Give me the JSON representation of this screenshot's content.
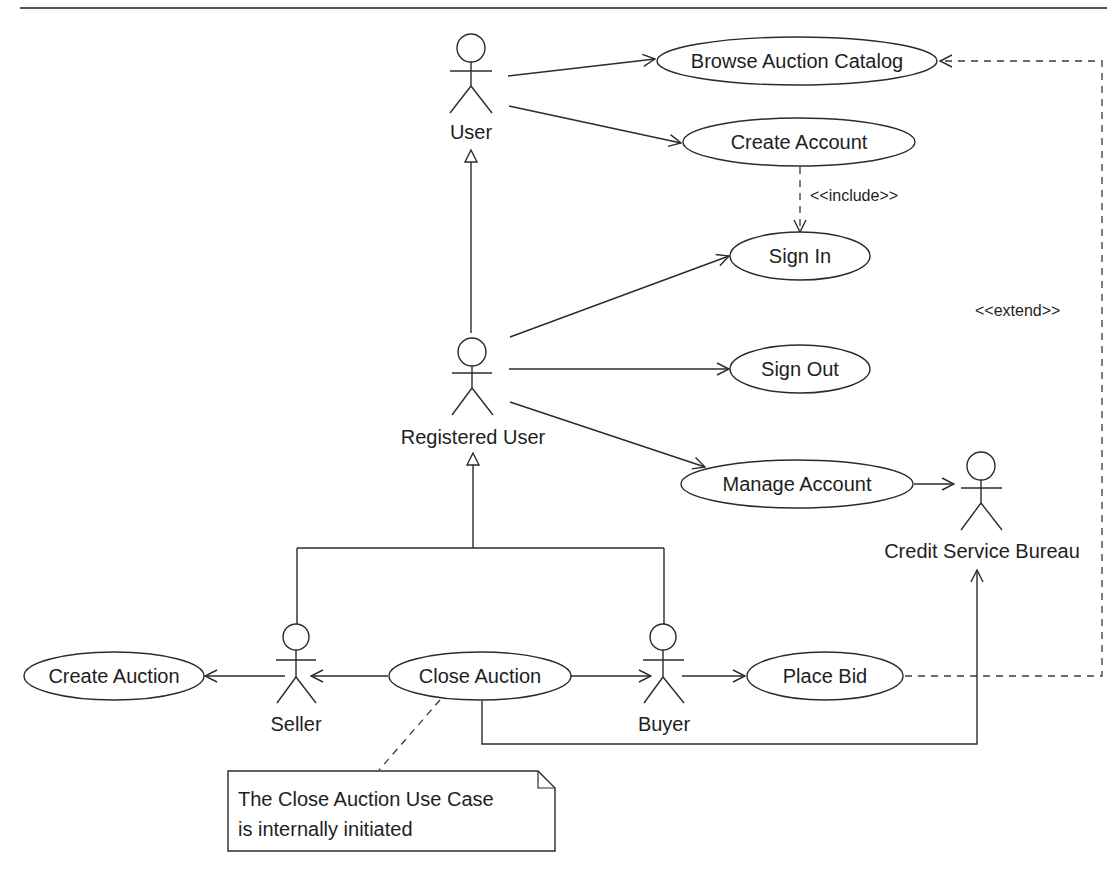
{
  "diagram": {
    "type": "UML use case diagram",
    "actors": [
      {
        "id": "user",
        "label": "User"
      },
      {
        "id": "registered_user",
        "label": "Registered User"
      },
      {
        "id": "seller",
        "label": "Seller"
      },
      {
        "id": "buyer",
        "label": "Buyer"
      },
      {
        "id": "credit_service_bureau",
        "label": "Credit Service Bureau"
      }
    ],
    "use_cases": [
      {
        "id": "browse_auction_catalog",
        "label": "Browse Auction Catalog"
      },
      {
        "id": "create_account",
        "label": "Create Account"
      },
      {
        "id": "sign_in",
        "label": "Sign In"
      },
      {
        "id": "sign_out",
        "label": "Sign Out"
      },
      {
        "id": "manage_account",
        "label": "Manage Account"
      },
      {
        "id": "create_auction",
        "label": "Create Auction"
      },
      {
        "id": "close_auction",
        "label": "Close Auction"
      },
      {
        "id": "place_bid",
        "label": "Place Bid"
      }
    ],
    "stereotypes": {
      "include": "<<include>>",
      "extend": "<<extend>>"
    },
    "note": {
      "line1": "The Close Auction Use Case",
      "line2": "is internally initiated"
    },
    "relationships": [
      {
        "from": "user",
        "to": "browse_auction_catalog",
        "kind": "association"
      },
      {
        "from": "user",
        "to": "create_account",
        "kind": "association"
      },
      {
        "from": "create_account",
        "to": "sign_in",
        "kind": "include"
      },
      {
        "from": "registered_user",
        "to": "user",
        "kind": "generalization"
      },
      {
        "from": "registered_user",
        "to": "sign_in",
        "kind": "association"
      },
      {
        "from": "registered_user",
        "to": "sign_out",
        "kind": "association"
      },
      {
        "from": "registered_user",
        "to": "manage_account",
        "kind": "association"
      },
      {
        "from": "manage_account",
        "to": "credit_service_bureau",
        "kind": "association"
      },
      {
        "from": "seller",
        "to": "registered_user",
        "kind": "generalization"
      },
      {
        "from": "buyer",
        "to": "registered_user",
        "kind": "generalization"
      },
      {
        "from": "seller",
        "to": "create_auction",
        "kind": "association"
      },
      {
        "from": "close_auction",
        "to": "seller",
        "kind": "association"
      },
      {
        "from": "close_auction",
        "to": "buyer",
        "kind": "association"
      },
      {
        "from": "buyer",
        "to": "place_bid",
        "kind": "association"
      },
      {
        "from": "close_auction",
        "to": "credit_service_bureau",
        "kind": "association"
      },
      {
        "from": "place_bid",
        "to": "browse_auction_catalog",
        "kind": "extend"
      }
    ],
    "colors": {
      "line": "#2b2b2b",
      "background": "#ffffff"
    }
  }
}
